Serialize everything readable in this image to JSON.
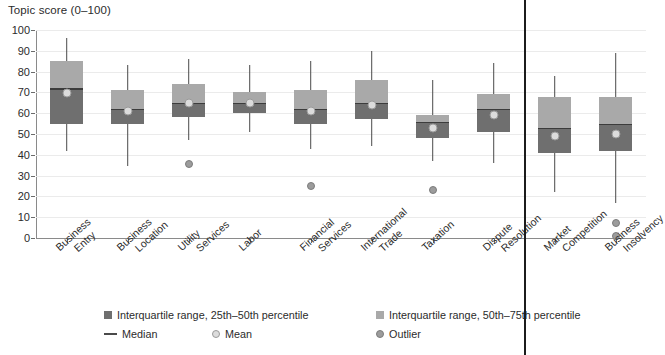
{
  "axis_title": "Topic score (0–100)",
  "legend": {
    "iqr_lower": "Interquartile range, 25th–50th percentile",
    "iqr_upper": "Interquartile range, 50th–75th percentile",
    "median": "Median",
    "mean": "Mean",
    "outlier": "Outlier"
  },
  "colors": {
    "iqr_lower": "#6f6f6f",
    "iqr_upper": "#a9a9a9",
    "median": "#3c3c3c",
    "mean": "#dcdcdc",
    "outlier": "#9c9c9c",
    "grid": "#ebebeb",
    "axis": "#8a8a8a"
  },
  "chart_data": {
    "type": "box",
    "title": "",
    "xlabel": "",
    "ylabel": "Topic score (0–100)",
    "ylim": [
      0,
      100
    ],
    "yticks": [
      0,
      10,
      20,
      30,
      40,
      50,
      60,
      70,
      80,
      90,
      100
    ],
    "grid": true,
    "legend_position": "bottom",
    "categories": [
      "Business Entry",
      "Business Location",
      "Utility Services",
      "Labor",
      "Financial Services",
      "International Trade",
      "Taxation",
      "Dispute Resolution",
      "Market Competition",
      "Business Insolvency"
    ],
    "boxes": [
      {
        "label": "Business Entry",
        "label_line1": "Business",
        "label_line2": "Entry",
        "whisker_low": 42,
        "q1": 55,
        "median": 72,
        "q3": 85,
        "whisker_high": 96,
        "mean": 69.5,
        "outliers": []
      },
      {
        "label": "Business Location",
        "label_line1": "Business",
        "label_line2": "Location",
        "whisker_low": 34.5,
        "q1": 55,
        "median": 62,
        "q3": 71,
        "whisker_high": 83,
        "mean": 61,
        "outliers": []
      },
      {
        "label": "Utility Services",
        "label_line1": "Utility",
        "label_line2": "Services",
        "whisker_low": 47,
        "q1": 58,
        "median": 65,
        "q3": 74,
        "whisker_high": 86,
        "mean": 65,
        "outliers": [
          35.5
        ]
      },
      {
        "label": "Labor",
        "label_line1": "Labor",
        "label_line2": "",
        "whisker_low": 51,
        "q1": 60,
        "median": 65,
        "q3": 70,
        "whisker_high": 83,
        "mean": 65,
        "outliers": []
      },
      {
        "label": "Financial Services",
        "label_line1": "Financial",
        "label_line2": "Services",
        "whisker_low": 43,
        "q1": 55,
        "median": 62,
        "q3": 71,
        "whisker_high": 85,
        "mean": 61,
        "outliers": [
          25
        ]
      },
      {
        "label": "International Trade",
        "label_line1": "International",
        "label_line2": "Trade",
        "whisker_low": 44,
        "q1": 57,
        "median": 65,
        "q3": 76,
        "whisker_high": 90,
        "mean": 64,
        "outliers": []
      },
      {
        "label": "Taxation",
        "label_line1": "Taxation",
        "label_line2": "",
        "whisker_low": 37,
        "q1": 48,
        "median": 56,
        "q3": 59,
        "whisker_high": 76,
        "mean": 53,
        "outliers": [
          23
        ]
      },
      {
        "label": "Dispute Resolution",
        "label_line1": "Dispute",
        "label_line2": "Resolution",
        "whisker_low": 36,
        "q1": 51,
        "median": 62,
        "q3": 69,
        "whisker_high": 84,
        "mean": 59,
        "outliers": []
      },
      {
        "label": "Market Competition",
        "label_line1": "Market",
        "label_line2": "Competition",
        "whisker_low": 22,
        "q1": 41,
        "median": 53,
        "q3": 68,
        "whisker_high": 78,
        "mean": 49,
        "outliers": []
      },
      {
        "label": "Business Insolvency",
        "label_line1": "Business",
        "label_line2": "Insolvency",
        "whisker_low": 17,
        "q1": 42,
        "median": 55,
        "q3": 68,
        "whisker_high": 89,
        "mean": 50,
        "outliers": [
          7,
          1
        ]
      }
    ]
  }
}
